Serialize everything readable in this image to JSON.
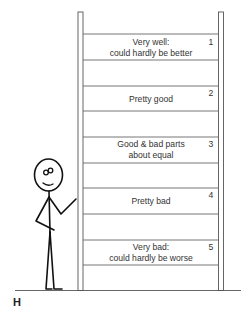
{
  "figure": {
    "label": "H",
    "rungs": [
      {
        "number": "1",
        "line1": "Very well:",
        "line2": "could hardly be better"
      },
      {
        "number": "2",
        "line1": "Pretty good",
        "line2": ""
      },
      {
        "number": "3",
        "line1": "Good & bad parts",
        "line2": "about equal"
      },
      {
        "number": "4",
        "line1": "Pretty bad",
        "line2": ""
      },
      {
        "number": "5",
        "line1": "Very bad:",
        "line2": "could hardly be worse"
      }
    ],
    "illustration": "stick-figure-pointing-at-ladder"
  }
}
